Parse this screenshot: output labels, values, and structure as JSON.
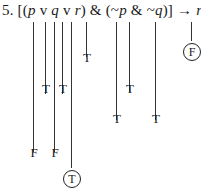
{
  "problem": {
    "number": "5.",
    "formula_parts": [
      "[(",
      "p",
      " v ",
      "q",
      " v ",
      "r",
      ") & (~",
      "p",
      " & ~",
      "q",
      ")] → ",
      "r"
    ]
  },
  "columns": [
    {
      "symbol": "p",
      "x": 33,
      "line_to": 152,
      "mark": "F",
      "mark_y": 146,
      "circled": false
    },
    {
      "symbol": "v1",
      "x": 45,
      "line_to": 94,
      "mark": "T",
      "mark_y": 82,
      "circled": false
    },
    {
      "symbol": "q",
      "x": 54,
      "line_to": 152,
      "mark": "F",
      "mark_y": 146,
      "circled": false
    },
    {
      "symbol": "v2",
      "x": 62,
      "line_to": 94,
      "mark": "T",
      "mark_y": 82,
      "circled": false
    },
    {
      "symbol": "r",
      "x": 71,
      "line_to": 168,
      "mark": "T",
      "mark_y": 170,
      "circled": true
    },
    {
      "symbol": "&1",
      "x": 86,
      "line_to": 57,
      "mark": "T",
      "mark_y": 51,
      "circled": false
    },
    {
      "symbol": "~p",
      "x": 116,
      "line_to": 120,
      "mark": "T",
      "mark_y": 112,
      "circled": false
    },
    {
      "symbol": "&2",
      "x": 129,
      "line_to": 92,
      "mark": "T",
      "mark_y": 82,
      "circled": false
    },
    {
      "symbol": "~q",
      "x": 155,
      "line_to": 120,
      "mark": "T",
      "mark_y": 112,
      "circled": false
    },
    {
      "symbol": "r_consequent",
      "x": 191,
      "line_to": 41,
      "mark": "F",
      "mark_y": 43,
      "circled": true
    }
  ]
}
